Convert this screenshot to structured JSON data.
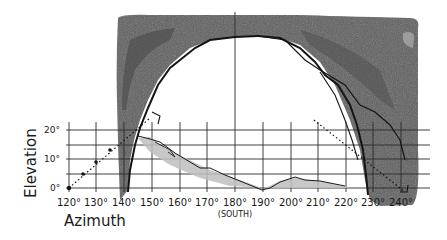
{
  "diagram": {
    "type": "sun-path horizon obstruction sketch",
    "colors": {
      "shade_dark": "#5a5a5a",
      "shade_mid": "#707070",
      "shade_light": "#bdbdbd",
      "ink": "#141414",
      "grid": "#2a2a2a"
    },
    "axes": {
      "x_title": "Azimuth",
      "y_title": "Elevation",
      "x_ticks": [
        {
          "label": "120°",
          "x": 69
        },
        {
          "label": "130°",
          "x": 96
        },
        {
          "label": "140°",
          "x": 124
        },
        {
          "label": "150°",
          "x": 152
        },
        {
          "label": "160°",
          "x": 180
        },
        {
          "label": "170°",
          "x": 207
        },
        {
          "label": "180°",
          "x": 235
        },
        {
          "label": "190°",
          "x": 263
        },
        {
          "label": "200°",
          "x": 291
        },
        {
          "label": "210°",
          "x": 318
        },
        {
          "label": "220°",
          "x": 346
        },
        {
          "label": "230°",
          "x": 373
        },
        {
          "label": "240°",
          "x": 401
        }
      ],
      "y_ticks": [
        {
          "label": "20°",
          "y": 130
        },
        {
          "label": "10°",
          "y": 159
        },
        {
          "label": "0°",
          "y": 188
        }
      ],
      "south_label": "(SOUTH)"
    }
  }
}
